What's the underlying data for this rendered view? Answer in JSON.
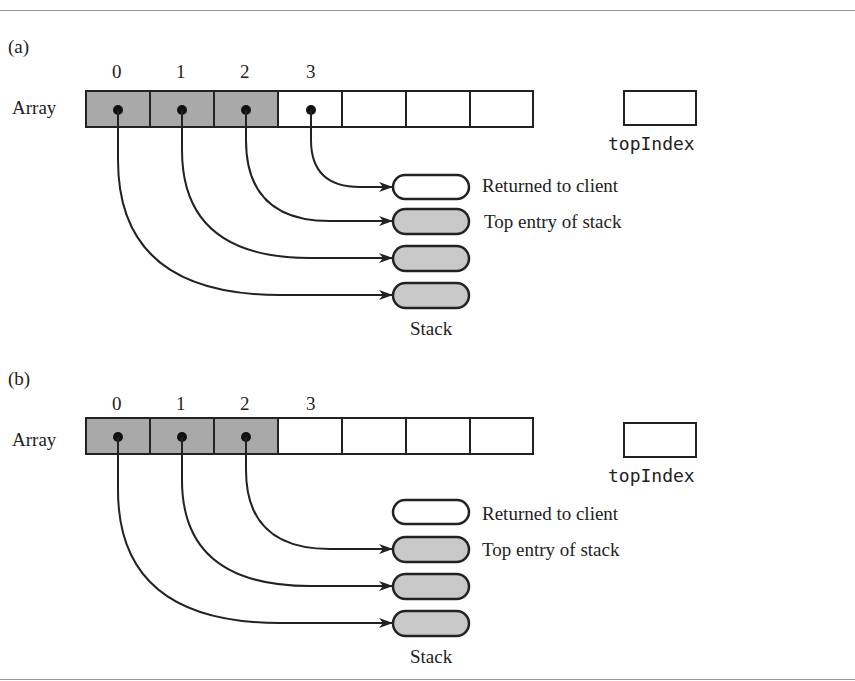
{
  "panels": [
    {
      "label": "(a)",
      "array_label": "Array",
      "indices": [
        "0",
        "1",
        "2",
        "3"
      ],
      "cells": [
        {
          "state": "filled",
          "content": "ref"
        },
        {
          "state": "filled",
          "content": "ref"
        },
        {
          "state": "filled",
          "content": "ref"
        },
        {
          "state": "empty",
          "content": "ref"
        },
        {
          "state": "empty",
          "content": ""
        },
        {
          "state": "empty",
          "content": ""
        },
        {
          "state": "empty",
          "content": ""
        }
      ],
      "top_index_value": "2",
      "top_index_label": "topIndex",
      "stack_entries": [
        {
          "fill": "white",
          "annotation": "Returned to client",
          "from_cell": 3
        },
        {
          "fill": "gray",
          "annotation": "Top entry of stack",
          "from_cell": 2
        },
        {
          "fill": "gray",
          "annotation": "",
          "from_cell": 1
        },
        {
          "fill": "gray",
          "annotation": "",
          "from_cell": 0
        }
      ],
      "stack_label": "Stack"
    },
    {
      "label": "(b)",
      "array_label": "Array",
      "indices": [
        "0",
        "1",
        "2",
        "3"
      ],
      "cells": [
        {
          "state": "filled",
          "content": "ref"
        },
        {
          "state": "filled",
          "content": "ref"
        },
        {
          "state": "filled",
          "content": "ref"
        },
        {
          "state": "empty",
          "content": "null"
        },
        {
          "state": "empty",
          "content": ""
        },
        {
          "state": "empty",
          "content": ""
        },
        {
          "state": "empty",
          "content": ""
        }
      ],
      "top_index_value": "2",
      "top_index_label": "topIndex",
      "stack_entries": [
        {
          "fill": "white",
          "annotation": "Returned to client",
          "from_cell": null
        },
        {
          "fill": "gray",
          "annotation": "Top entry of stack",
          "from_cell": 2
        },
        {
          "fill": "gray",
          "annotation": "",
          "from_cell": 1
        },
        {
          "fill": "gray",
          "annotation": "",
          "from_cell": 0
        }
      ],
      "stack_label": "Stack"
    }
  ],
  "colors": {
    "filled_cell": "#a9a9a9",
    "stack_gray": "#c8c8c8",
    "stroke": "#222222"
  }
}
